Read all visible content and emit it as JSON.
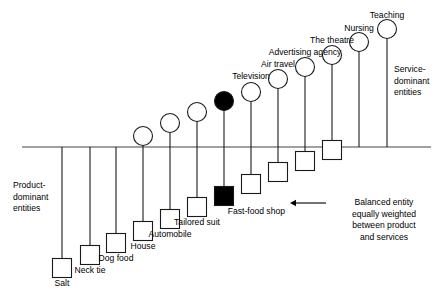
{
  "figure": {
    "axis": {
      "x_start": 22,
      "x_end": 431,
      "y": 147,
      "color": "#808080"
    },
    "side_labels": {
      "left": "Product-\ndominant\nentities",
      "right": "Service-\ndominant\nentities"
    },
    "annotation": {
      "text": "Balanced entity\nequally weighted\nbetween product\nand services",
      "target_label": "Fast-food shop",
      "arrow_from_x": 326,
      "arrow_to_x": 290,
      "arrow_y": 203
    }
  },
  "chart_data": {
    "type": "scatter",
    "title": "",
    "xlabel": "",
    "ylabel": "",
    "axis_note": "Tangible (square) marker below the axis; intangible (circle) marker above the axis. Marker distance from the axis encodes dominance of product vs. service.",
    "legend": [
      {
        "shape": "square",
        "meaning": "tangible dominant",
        "position": "below axis"
      },
      {
        "shape": "circle",
        "meaning": "intangible dominant",
        "position": "above axis"
      },
      {
        "shape": "filled",
        "meaning": "balanced entity equally weighted between product and services"
      }
    ],
    "categories": [
      "Salt",
      "Neck tie",
      "Dog food",
      "House",
      "Automobile",
      "Tailored suit",
      "Fast-food shop",
      "Television",
      "Air travel",
      "Advertising agency",
      "The theatre",
      "Nursing",
      "Teaching"
    ],
    "points": [
      {
        "label": "Salt",
        "x": 62,
        "tangible_y": 268,
        "intangible_y": null,
        "square_filled": false,
        "circle_filled": false,
        "has_circle": false,
        "label_y": 278,
        "label_align": "center"
      },
      {
        "label": "Neck tie",
        "x": 90,
        "tangible_y": 255,
        "intangible_y": null,
        "square_filled": false,
        "circle_filled": false,
        "has_circle": false,
        "label_y": 265,
        "label_align": "center"
      },
      {
        "label": "Dog food",
        "x": 116,
        "tangible_y": 243,
        "intangible_y": null,
        "square_filled": false,
        "circle_filled": false,
        "has_circle": false,
        "label_y": 253,
        "label_align": "center"
      },
      {
        "label": "House",
        "x": 143,
        "tangible_y": 231,
        "intangible_y": 136,
        "square_filled": false,
        "circle_filled": false,
        "has_circle": true,
        "label_y": 241,
        "label_align": "center"
      },
      {
        "label": "Automobile",
        "x": 170,
        "tangible_y": 219,
        "intangible_y": 123,
        "square_filled": false,
        "circle_filled": false,
        "has_circle": true,
        "label_y": 229,
        "label_align": "center"
      },
      {
        "label": "Tailored suit",
        "x": 197,
        "tangible_y": 207,
        "intangible_y": 112,
        "square_filled": false,
        "circle_filled": false,
        "has_circle": true,
        "label_y": 217,
        "label_align": "center"
      },
      {
        "label": "Fast-food shop",
        "x": 224,
        "tangible_y": 196,
        "intangible_y": 101,
        "square_filled": true,
        "circle_filled": true,
        "has_circle": true,
        "label_y": 206,
        "label_align": "right-of-marker"
      },
      {
        "label": "Television",
        "x": 251,
        "tangible_y": 184,
        "intangible_y": 92,
        "square_filled": false,
        "circle_filled": false,
        "has_circle": true,
        "label_y": 71,
        "label_align": "above"
      },
      {
        "label": "Air travel",
        "x": 278,
        "tangible_y": 172,
        "intangible_y": 79,
        "square_filled": false,
        "circle_filled": false,
        "has_circle": true,
        "label_y": 59,
        "label_align": "above"
      },
      {
        "label": "Advertising agency",
        "x": 305,
        "tangible_y": 161,
        "intangible_y": 67,
        "square_filled": false,
        "circle_filled": false,
        "has_circle": true,
        "label_y": 47,
        "label_align": "above"
      },
      {
        "label": "The theatre",
        "x": 332,
        "tangible_y": 150,
        "intangible_y": 55,
        "square_filled": false,
        "circle_filled": false,
        "has_circle": true,
        "label_y": 35,
        "label_align": "above"
      },
      {
        "label": "Nursing",
        "x": 359,
        "tangible_y": null,
        "intangible_y": 42,
        "square_filled": false,
        "circle_filled": false,
        "has_circle": true,
        "label_y": 23,
        "label_align": "above"
      },
      {
        "label": "Teaching",
        "x": 387,
        "tangible_y": null,
        "intangible_y": 29,
        "square_filled": false,
        "circle_filled": false,
        "has_circle": true,
        "label_y": 10,
        "label_align": "above"
      }
    ],
    "marker_size": {
      "square": 19,
      "circle_r": 9.5
    }
  }
}
